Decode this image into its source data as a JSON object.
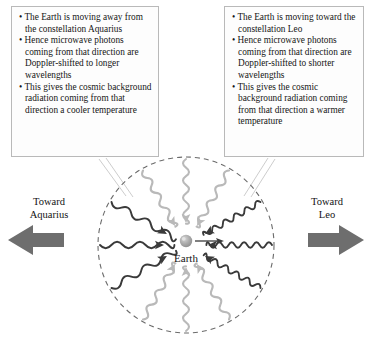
{
  "figure": {
    "center_label": "Earth",
    "circle": {
      "cx": 186,
      "cy": 245,
      "r": 88,
      "stroke": "#6b6b6b",
      "dashed": true
    }
  },
  "callouts": {
    "left": {
      "name": "aquarius-explanation",
      "lines": [
        "• The Earth is moving away from the constellation Aquarius",
        "• Hence microwave photons coming from that direction are Doppler-shifted to longer wavelengths",
        "• This gives the cosmic background radiation coming from that direction a cooler temperature"
      ]
    },
    "right": {
      "name": "leo-explanation",
      "lines": [
        "• The Earth is moving toward the constellation Leo",
        "• Hence microwave photons coming from that direction are Doppler-shifted to shorter wavelengths",
        "• This gives the cosmic background radiation coming from that direction a warmer temperature"
      ]
    }
  },
  "direction_labels": {
    "left": {
      "line1": "Toward",
      "line2": "Aquarius"
    },
    "right": {
      "line1": "Toward",
      "line2": "Leo"
    }
  },
  "motion_arrows": {
    "left_block_arrow": "toward-aquarius-arrow",
    "right_block_arrow": "toward-leo-arrow",
    "earth_velocity_arrow": "earth-motion-arrow",
    "block_arrow_color": "#6e6e6e"
  },
  "colors": {
    "dark_wave": "#3a3a3a",
    "light_wave": "#b9b9b9",
    "earth_body": "#a8a8a8",
    "circle_stroke": "#6b6b6b",
    "box_border": "#b9b9b9",
    "leader_line": "#c9c9c9",
    "text": "#151515"
  },
  "waves": [
    {
      "id": "wave-w",
      "angle_deg": 180,
      "tone": "dark",
      "wavelength": "long",
      "cycles": 3.5,
      "note": "Aquarius side, redshifted"
    },
    {
      "id": "wave-wnw",
      "angle_deg": 150,
      "tone": "dark",
      "wavelength": "long",
      "cycles": 3.5,
      "note": "Aquarius side, redshifted"
    },
    {
      "id": "wave-wsw",
      "angle_deg": 210,
      "tone": "dark",
      "wavelength": "long",
      "cycles": 3.5,
      "note": "Aquarius side, redshifted"
    },
    {
      "id": "wave-nnw",
      "angle_deg": 120,
      "tone": "light",
      "wavelength": "medium",
      "cycles": 5,
      "note": "transverse"
    },
    {
      "id": "wave-n",
      "angle_deg": 90,
      "tone": "light",
      "wavelength": "medium",
      "cycles": 5,
      "note": "transverse"
    },
    {
      "id": "wave-nne",
      "angle_deg": 60,
      "tone": "light",
      "wavelength": "medium",
      "cycles": 5,
      "note": "transverse"
    },
    {
      "id": "wave-ssw",
      "angle_deg": 240,
      "tone": "light",
      "wavelength": "medium",
      "cycles": 5,
      "note": "transverse"
    },
    {
      "id": "wave-s",
      "angle_deg": 270,
      "tone": "light",
      "wavelength": "medium",
      "cycles": 5,
      "note": "transverse"
    },
    {
      "id": "wave-sse",
      "angle_deg": 300,
      "tone": "light",
      "wavelength": "medium",
      "cycles": 5,
      "note": "transverse"
    },
    {
      "id": "wave-ene",
      "angle_deg": 30,
      "tone": "dark",
      "wavelength": "short",
      "cycles": 7,
      "note": "Leo side, blueshifted"
    },
    {
      "id": "wave-e",
      "angle_deg": 0,
      "tone": "dark",
      "wavelength": "short",
      "cycles": 7,
      "note": "Leo side, blueshifted"
    },
    {
      "id": "wave-ese",
      "angle_deg": 330,
      "tone": "dark",
      "wavelength": "short",
      "cycles": 7,
      "note": "Leo side, blueshifted"
    }
  ]
}
